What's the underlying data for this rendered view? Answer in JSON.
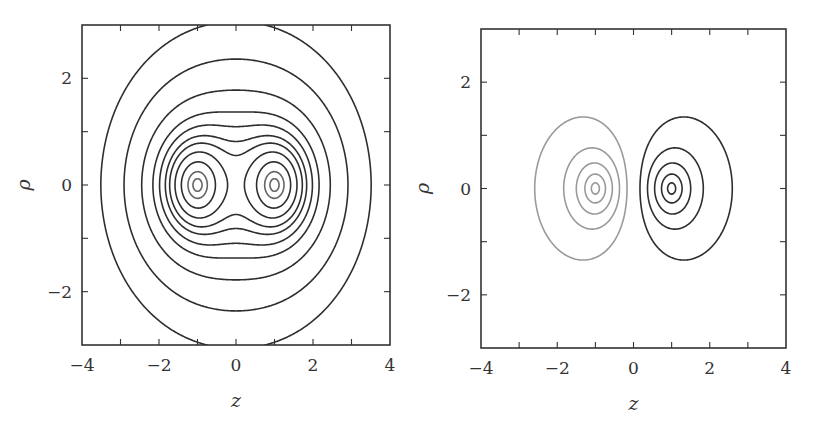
{
  "chart_data": [
    {
      "type": "contour",
      "title": "",
      "xlabel": "z",
      "ylabel": "ρ",
      "xlim": [
        -4,
        4
      ],
      "ylim": [
        -3,
        3
      ],
      "xticks": [
        -4,
        -2,
        0,
        2,
        4
      ],
      "xtick_labels": [
        "−4",
        "−2",
        "0",
        "2",
        "4"
      ],
      "yticks": [
        -2,
        0,
        2
      ],
      "ytick_labels": [
        "−2",
        "0",
        "2"
      ],
      "minor_xticks": [
        -3,
        -1,
        1,
        3
      ],
      "minor_yticks": [
        -1,
        1
      ],
      "grid": false,
      "legend": null,
      "description": "Symmetric pair of like point sources at z=±1, rho=0; closed contours around each source merging into peanut then oval shapes",
      "sources": [
        {
          "z": -1,
          "rho": 0,
          "q": 1
        },
        {
          "z": 1,
          "rho": 0,
          "q": 1
        }
      ],
      "levels": [
        0.62,
        0.78,
        0.98,
        1.18,
        1.35,
        1.55,
        1.75,
        2.1,
        2.8,
        4.5,
        9
      ],
      "frame_px": {
        "left": 82,
        "top": 25,
        "right": 390,
        "bottom": 345
      }
    },
    {
      "type": "contour",
      "title": "",
      "xlabel": "z",
      "ylabel": "ρ",
      "xlim": [
        -4,
        4
      ],
      "ylim": [
        -3,
        3
      ],
      "xticks": [
        -4,
        -2,
        0,
        2,
        4
      ],
      "xtick_labels": [
        "−4",
        "−2",
        "0",
        "2",
        "4"
      ],
      "yticks": [
        -2,
        0,
        2
      ],
      "ytick_labels": [
        "−2",
        "0",
        "2"
      ],
      "minor_xticks": [
        -3,
        -1,
        1,
        3
      ],
      "minor_yticks": [
        -1,
        1
      ],
      "grid": false,
      "legend": null,
      "description": "Dipole: opposite point sources at z=-1 (negative, light gray contours) and z=+1 (positive, dark contours); nested closed contours around each",
      "sources": [
        {
          "z": -1,
          "rho": 0,
          "q": -1
        },
        {
          "z": 1,
          "rho": 0,
          "q": 1
        }
      ],
      "levels": [
        -9,
        -3.2,
        -1.6,
        -0.85,
        -0.35,
        0.35,
        0.85,
        1.6,
        3.2,
        9
      ],
      "frame_px": {
        "left": 481,
        "top": 29,
        "right": 786,
        "bottom": 348
      }
    }
  ],
  "style": {
    "frame_color": "#333333",
    "positive_contour_color": "#2e2e2e",
    "negative_contour_color": "#9a9a9a",
    "mid_contour_color": "#666666"
  }
}
